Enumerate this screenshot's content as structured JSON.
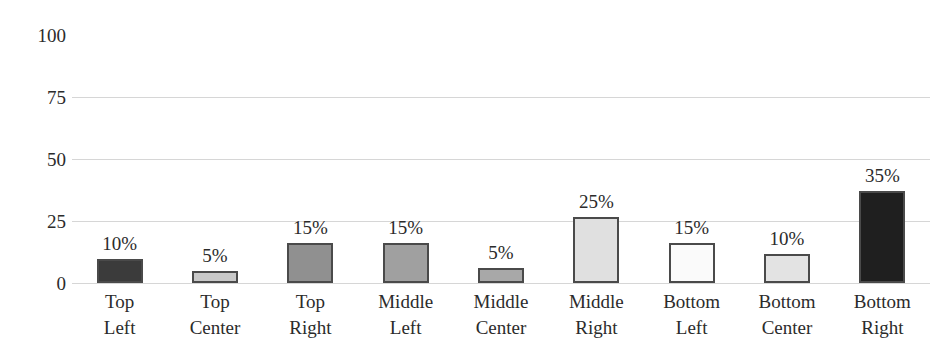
{
  "chart_data": {
    "type": "bar",
    "title": "",
    "subtitle": "",
    "xlabel": "",
    "ylabel": "",
    "ylim": [
      0,
      100
    ],
    "yticks": [
      0,
      25,
      50,
      75,
      100
    ],
    "ytick_labels": [
      "0",
      "25",
      "50",
      "75",
      "100"
    ],
    "gridlines_at": [
      0,
      25,
      50,
      75
    ],
    "grid": true,
    "legend": false,
    "legend_position": "none",
    "categories": [
      "Top Left",
      "Top Center",
      "Top Right",
      "Middle Left",
      "Middle Center",
      "Middle Right",
      "Bottom Left",
      "Bottom Center",
      "Bottom Right"
    ],
    "category_lines": [
      [
        "Top",
        "Left"
      ],
      [
        "Top",
        "Center"
      ],
      [
        "Top",
        "Right"
      ],
      [
        "Middle",
        "Left"
      ],
      [
        "Middle",
        "Center"
      ],
      [
        "Middle",
        "Right"
      ],
      [
        "Bottom",
        "Left"
      ],
      [
        "Bottom",
        "Center"
      ],
      [
        "Bottom",
        "Right"
      ]
    ],
    "values": [
      9.5,
      5,
      16,
      16,
      6,
      26.5,
      16,
      11.5,
      37
    ],
    "data_labels": [
      "10%",
      "5%",
      "15%",
      "15%",
      "5%",
      "25%",
      "15%",
      "10%",
      "35%"
    ],
    "bar_colors": [
      "#3b3b3b",
      "#c8c8c8",
      "#909090",
      "#a0a0a0",
      "#a8a8a8",
      "#e0e0e0",
      "#fafafa",
      "#e3e3e3",
      "#1f1f1f"
    ],
    "bar_border_color": "#4a4a4a",
    "gridline_color": "#d6d6d6",
    "text_color": "#2b2b2b",
    "background": "#ffffff"
  },
  "bars": [
    {
      "label": "10%",
      "line1": "Top",
      "line2": "Left"
    },
    {
      "label": "5%",
      "line1": "Top",
      "line2": "Center"
    },
    {
      "label": "15%",
      "line1": "Top",
      "line2": "Right"
    },
    {
      "label": "15%",
      "line1": "Middle",
      "line2": "Left"
    },
    {
      "label": "5%",
      "line1": "Middle",
      "line2": "Center"
    },
    {
      "label": "25%",
      "line1": "Middle",
      "line2": "Right"
    },
    {
      "label": "15%",
      "line1": "Bottom",
      "line2": "Left"
    },
    {
      "label": "10%",
      "line1": "Bottom",
      "line2": "Center"
    },
    {
      "label": "35%",
      "line1": "Bottom",
      "line2": "Right"
    }
  ],
  "y_axis": {
    "labels": [
      "100",
      "75",
      "50",
      "25",
      "0"
    ]
  }
}
